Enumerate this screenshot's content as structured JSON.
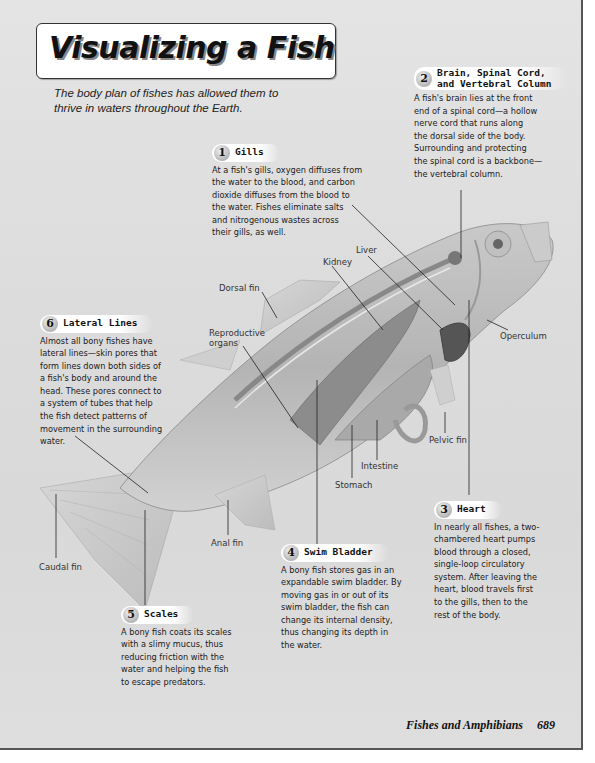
{
  "page": {
    "title": "Visualizing a Fish",
    "intro": "The body plan of fishes has allowed them to thrive in waters throughout the Earth.",
    "footer": {
      "chapter": "Fishes and Amphibians",
      "page_number": "689"
    }
  },
  "callouts": [
    {
      "number": "1",
      "title": "Gills",
      "body": "At a fish's gills, oxygen diffuses from\nthe water to the blood, and carbon\ndioxide diffuses from the blood to\nthe water. Fishes eliminate salts\nand nitrogenous wastes across\ntheir gills, as well."
    },
    {
      "number": "2",
      "title": "Brain, Spinal Cord,\nand Vertebral Column",
      "body": "A fish's brain lies at the front\nend of a spinal cord—a hollow\nnerve cord that runs along\nthe dorsal side of the body.\nSurrounding and protecting\nthe spinal cord is a backbone—\nthe vertebral column."
    },
    {
      "number": "3",
      "title": "Heart",
      "body": "In nearly all fishes, a two-\nchambered heart pumps\nblood through a closed,\nsingle-loop circulatory\nsystem. After leaving the\nheart, blood travels first\nto the gills, then to the\nrest of the body."
    },
    {
      "number": "4",
      "title": "Swim Bladder",
      "body": "A bony fish stores gas in an\nexpandable swim bladder. By\nmoving gas in or out of its\nswim bladder, the fish can\nchange its internal density,\nthus changing its depth in\nthe water."
    },
    {
      "number": "5",
      "title": "Scales",
      "body": "A bony fish coats its scales\nwith a slimy mucus, thus\nreducing friction with the\nwater and helping the fish\nto escape predators."
    },
    {
      "number": "6",
      "title": "Lateral Lines",
      "body": "Almost all bony fishes have\nlateral lines—skin pores that\nform lines down both sides of\na fish's body and around the\nhead. These pores connect to\na system of tubes that help\nthe fish detect patterns of\nmovement in the surrounding\nwater."
    }
  ],
  "labels": {
    "liver": "Liver",
    "kidney": "Kidney",
    "dorsal_fin": "Dorsal fin",
    "reproductive_organs": "Reproductive\norgans",
    "operculum": "Operculum",
    "pelvic_fin": "Pelvic fin",
    "intestine": "Intestine",
    "stomach": "Stomach",
    "anal_fin": "Anal fin",
    "caudal_fin": "Caudal fin"
  }
}
